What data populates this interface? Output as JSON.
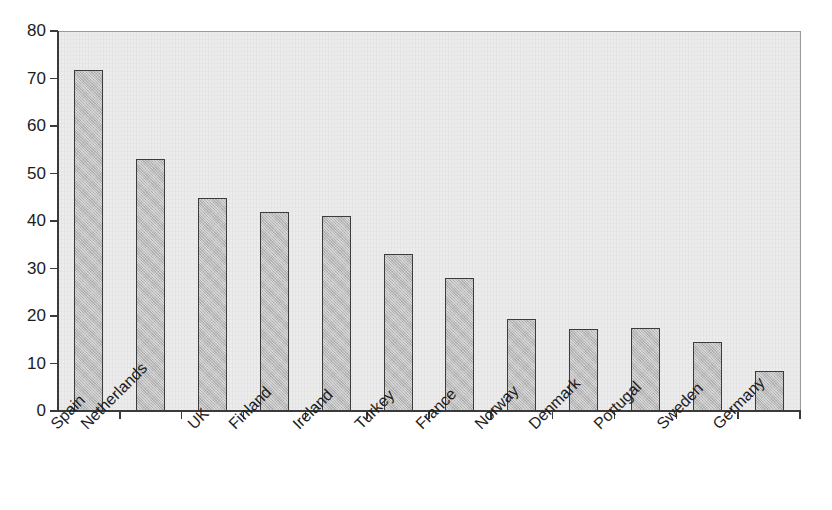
{
  "chart_data": {
    "type": "bar",
    "title": "",
    "subtitle": "",
    "xlabel": "",
    "ylabel": "",
    "ylim": [
      0,
      80
    ],
    "ytick_step": 10,
    "yticks": [
      0,
      10,
      20,
      30,
      40,
      50,
      60,
      70,
      80
    ],
    "ytick_labels": [
      "0",
      "10",
      "20",
      "30",
      "40",
      "50",
      "60",
      "70",
      "80"
    ],
    "grid": false,
    "legend": false,
    "legend_position": "none",
    "categories": [
      "Spain",
      "Netherlands",
      "UK",
      "Finland",
      "Ireland",
      "Turkey",
      "France",
      "Norway",
      "Denmark",
      "Portugal",
      "Sweden",
      "Germany"
    ],
    "values": [
      72.0,
      53.3,
      45.0,
      42.1,
      41.3,
      33.2,
      28.3,
      19.6,
      17.5,
      17.6,
      14.7,
      8.7
    ],
    "series": [
      {
        "name": "",
        "values": [
          72.0,
          53.3,
          45.0,
          42.1,
          41.3,
          33.2,
          28.3,
          19.6,
          17.5,
          17.6,
          14.7,
          8.7
        ]
      }
    ],
    "annotations": []
  },
  "style": {
    "bar_fill": "#bcbcbc",
    "bar_border": "#3c3c3c",
    "plot_background": "#ececec",
    "axis_color": "#3a3a3a",
    "text_color": "#1c1c1c",
    "page_background": "#ffffff"
  }
}
